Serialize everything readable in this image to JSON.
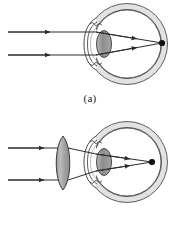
{
  "figure": {
    "panels": [
      {
        "id": "a",
        "caption": "(a)",
        "description": "Uncorrected farsighted eye: parallel rays refract at cornea and crystalline lens and converge behind the retina",
        "external_lens": false,
        "focus_on_retina": false,
        "focus_point": {
          "x": 162,
          "y": 43
        },
        "rays": [
          {
            "y_in": 32,
            "label": "upper-parallel-ray"
          },
          {
            "y_in": 55,
            "label": "lower-parallel-ray"
          }
        ],
        "eye": {
          "center": {
            "x": 127,
            "y": 44
          },
          "radius": 36,
          "cornea_label": "cornea",
          "lens_label": "crystalline-lens",
          "retina_label": "retina",
          "sclera_label": "sclera"
        }
      },
      {
        "id": "b",
        "caption": "(b)",
        "description": "Corrected farsighted eye: a converging (biconvex) spectacle lens bends parallel rays so they focus on the retina",
        "external_lens": true,
        "focus_on_retina": true,
        "focus_point": {
          "x": 152,
          "y": 162
        },
        "rays": [
          {
            "y_in": 148,
            "label": "upper-parallel-ray"
          },
          {
            "y_in": 180,
            "label": "lower-parallel-ray"
          }
        ],
        "corrective_lens": {
          "label": "converging-lens",
          "center": {
            "x": 63,
            "y": 163
          },
          "half_height": 27,
          "half_width": 10
        },
        "eye": {
          "center": {
            "x": 127,
            "y": 162
          },
          "radius": 36,
          "cornea_label": "cornea",
          "lens_label": "crystalline-lens",
          "retina_label": "retina",
          "sclera_label": "sclera"
        }
      }
    ]
  },
  "colors": {
    "ink": "#1a1a1a",
    "stroke": "#2b2b2b",
    "sclera_band": "#d9d9d9",
    "sclera_band_light": "#ececec",
    "lens_grey": "#8d8d8d",
    "lens_grey_light": "#c9c9c9",
    "eye_lens_grey": "#8a8a8a",
    "background": "#ffffff",
    "focus_dot": "#111111"
  }
}
